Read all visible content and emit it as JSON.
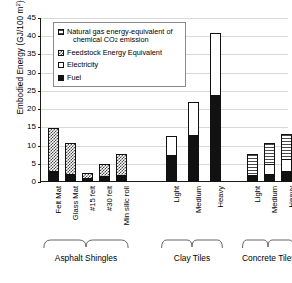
{
  "chart_data": {
    "type": "bar",
    "title": "",
    "xlabel": "",
    "ylabel": "Embodied Energy (GJ/100 m",
    "ylabel_sup": "2",
    "ylabel_suffix": ")",
    "ylim": [
      0,
      45
    ],
    "ytick_step": 5,
    "yticks": [
      0,
      5,
      10,
      15,
      20,
      25,
      30,
      35,
      40,
      45
    ],
    "grid": true,
    "stacked": true,
    "legend_position": "upper-left-inside",
    "series": [
      {
        "name": "Natural gas energy-equivalent of chemical CO2 emission",
        "key": "ngas",
        "values": [
          0,
          0,
          0,
          0,
          0,
          0,
          0,
          0,
          6.0,
          6.0,
          7.0
        ]
      },
      {
        "name": "Feedstock Energy Equivalent",
        "key": "feed",
        "values": [
          12.2,
          8.7,
          1.6,
          3.7,
          6.1,
          0,
          0,
          0,
          0,
          0,
          0
        ]
      },
      {
        "name": "Electricity",
        "key": "elec",
        "values": [
          0,
          0,
          0,
          0,
          0,
          5.4,
          9.5,
          17.1,
          0,
          3.0,
          3.7
        ]
      },
      {
        "name": "Fuel",
        "key": "fuel",
        "values": [
          3.0,
          2.2,
          1.1,
          1.6,
          1.8,
          7.5,
          12.8,
          24.0,
          2.0,
          2.3,
          2.9
        ]
      }
    ],
    "categories": [
      "Felt Mat",
      "Glass Mat",
      "#15 felt",
      "#30 felt",
      "Min silic roll",
      "Light",
      "Medium",
      "Heavy",
      "Light",
      "Medium",
      "Heavy"
    ],
    "totals": [
      15.2,
      10.9,
      2.7,
      5.3,
      7.9,
      12.9,
      22.3,
      41.1,
      8.0,
      11.3,
      13.6
    ],
    "groups": [
      {
        "label": "Asphalt Shingles",
        "start": 0,
        "end": 4
      },
      {
        "label": "Clay Tiles",
        "start": 5,
        "end": 7
      },
      {
        "label": "Concrete Tiles",
        "start": 8,
        "end": 10
      }
    ],
    "legend": [
      {
        "label_line1": "Natural gas energy-equivalent of",
        "label_line2": "chemical CO",
        "label_sub": "2",
        "label_line2b": " emission",
        "key": "ngas"
      },
      {
        "label_line1": "Feedstock Energy Equivalent",
        "key": "feed"
      },
      {
        "label_line1": "Electricity",
        "key": "elec"
      },
      {
        "label_line1": "Fuel",
        "key": "fuel"
      }
    ],
    "colors": {
      "fuel": "#111111",
      "electricity": "#ffffff",
      "feedstock_hatch": "#4a4a4a",
      "natural_gas_hatch": "#4a4a4a",
      "axis": "#1a1a1a",
      "grid": "#d9d9d9"
    }
  }
}
